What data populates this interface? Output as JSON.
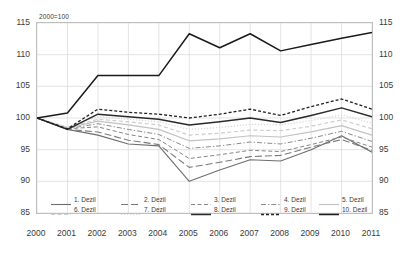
{
  "note": "2000=100",
  "axes": {
    "y_ticks": [
      "115",
      "110",
      "105",
      "100",
      "95",
      "90",
      "85"
    ],
    "x_ticks": [
      "2000",
      "2001",
      "2002",
      "2003",
      "2004",
      "2005",
      "2006",
      "2007",
      "2008",
      "2009",
      "2010",
      "2011"
    ]
  },
  "legend": {
    "row1": [
      {
        "label": "1. Dezil",
        "swatch": "solid-mid"
      },
      {
        "label": "2. Dezil",
        "swatch": "dash-long-mid"
      },
      {
        "label": "3. Dezil",
        "swatch": "dash-mid"
      },
      {
        "label": "4. Dezil",
        "swatch": "dashdot-mid"
      },
      {
        "label": "5. Dezil",
        "swatch": "solid-light"
      }
    ],
    "row2": [
      {
        "label": "6. Dezil",
        "swatch": "dash-light"
      },
      {
        "label": "7. Dezil",
        "swatch": "dot-light"
      },
      {
        "label": "8. Dezil",
        "swatch": "solid-dark"
      },
      {
        "label": "9. Dezil",
        "swatch": "dash-short-dark"
      },
      {
        "label": "10. Dezil",
        "swatch": "solid-darkest"
      }
    ]
  },
  "chart_data": {
    "type": "line",
    "title": "",
    "subtitle": "",
    "annotation": "2000=100",
    "xlabel": "",
    "ylabel": "",
    "x": [
      2000,
      2001,
      2002,
      2003,
      2004,
      2005,
      2006,
      2007,
      2008,
      2009,
      2010,
      2011
    ],
    "ylim": [
      85,
      115
    ],
    "ytick_step": 5,
    "grid": true,
    "legend_position": "bottom",
    "dual_y_axis": true,
    "series": [
      {
        "name": "1. Dezil",
        "style": "solid",
        "color": "#6e6e6e",
        "width": 1.1,
        "values": [
          100.0,
          98.2,
          97.3,
          95.9,
          95.6,
          90.0,
          91.8,
          93.4,
          93.2,
          95.0,
          97.2,
          94.6
        ]
      },
      {
        "name": "2. Dezil",
        "style": "dash-long",
        "color": "#7a7a7a",
        "width": 1.1,
        "values": [
          100.0,
          98.2,
          97.8,
          96.5,
          95.8,
          92.2,
          93.0,
          93.9,
          94.1,
          95.4,
          96.6,
          94.9
        ]
      },
      {
        "name": "3. Dezil",
        "style": "dash",
        "color": "#858585",
        "width": 1.0,
        "values": [
          100.0,
          98.3,
          98.6,
          97.4,
          96.6,
          93.6,
          94.2,
          94.9,
          94.7,
          95.8,
          97.0,
          95.4
        ]
      },
      {
        "name": "4. Dezil",
        "style": "dashdot",
        "color": "#8c8c8c",
        "width": 1.0,
        "values": [
          100.0,
          98.3,
          99.1,
          98.2,
          97.4,
          95.2,
          95.6,
          96.2,
          95.9,
          96.8,
          97.9,
          96.3
        ]
      },
      {
        "name": "5. Dezil",
        "style": "solid",
        "color": "#c2c2c2",
        "width": 1.2,
        "values": [
          100.0,
          98.4,
          99.5,
          98.9,
          98.2,
          96.4,
          96.7,
          97.2,
          97.0,
          97.8,
          98.8,
          97.3
        ]
      },
      {
        "name": "6. Dezil",
        "style": "dash",
        "color": "#cdcdcd",
        "width": 1.2,
        "values": [
          100.0,
          98.5,
          99.8,
          99.4,
          98.9,
          97.3,
          97.6,
          98.1,
          98.0,
          98.7,
          99.7,
          98.3
        ]
      },
      {
        "name": "7. Dezil",
        "style": "dot",
        "color": "#d6d6d6",
        "width": 1.2,
        "values": [
          100.0,
          98.6,
          100.2,
          99.8,
          99.4,
          98.2,
          98.5,
          99.0,
          98.9,
          99.6,
          100.5,
          99.2
        ]
      },
      {
        "name": "8. Dezil",
        "style": "solid",
        "color": "#2a2a2a",
        "width": 1.5,
        "values": [
          100.0,
          98.2,
          100.6,
          100.2,
          99.8,
          98.9,
          99.4,
          100.0,
          99.3,
          100.4,
          101.6,
          100.2
        ]
      },
      {
        "name": "9. Dezil",
        "style": "dash-short",
        "color": "#1f1f1f",
        "width": 1.3,
        "values": [
          100.0,
          98.3,
          101.4,
          100.9,
          100.6,
          100.0,
          100.6,
          101.4,
          100.4,
          101.8,
          103.0,
          101.4
        ]
      },
      {
        "name": "10. Dezil",
        "style": "solid",
        "color": "#1a1a1a",
        "width": 1.5,
        "values": [
          100.0,
          100.8,
          106.7,
          106.7,
          106.7,
          113.3,
          111.1,
          113.3,
          110.6,
          111.6,
          112.6,
          113.5
        ]
      }
    ]
  }
}
